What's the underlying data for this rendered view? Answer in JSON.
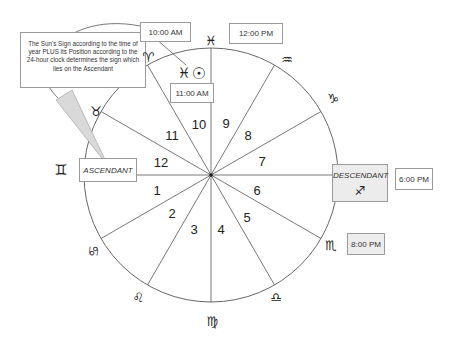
{
  "diagram": {
    "type": "astrological-house-wheel",
    "callout": {
      "text": "The Sun's Sign according to the time of year PLUS its Position according  to the 24-hour clock determines the sign which lies on the Ascendant"
    },
    "ascendant_label": "ASCENDANT",
    "descendant": {
      "label": "DESCENDANT",
      "sign_glyph": "♐"
    },
    "time_labels": {
      "t1000": "10:00 AM",
      "t1100": "11:00 AM",
      "t1200": "12:00 PM",
      "t1800": "6:00 PM",
      "t2000": "8:00 PM"
    },
    "sun_marker": {
      "sign_glyph": "♓",
      "sun_glyph": "☉"
    },
    "houses": [
      "1",
      "2",
      "3",
      "4",
      "5",
      "6",
      "7",
      "8",
      "9",
      "10",
      "11",
      "12"
    ],
    "signs": {
      "pisces": "♓",
      "aquarius": "♒",
      "capricorn": "♑",
      "scorpio": "♏",
      "libra": "♎",
      "virgo": "♍",
      "leo": "♌",
      "cancer": "♋",
      "gemini": "♊",
      "taurus": "♉",
      "aries": "♈"
    },
    "colors": {
      "line": "#555555",
      "box_border": "#9a9a9a",
      "shaded_box": "#ececec",
      "pointer_fill": "#d9d9d9"
    }
  }
}
